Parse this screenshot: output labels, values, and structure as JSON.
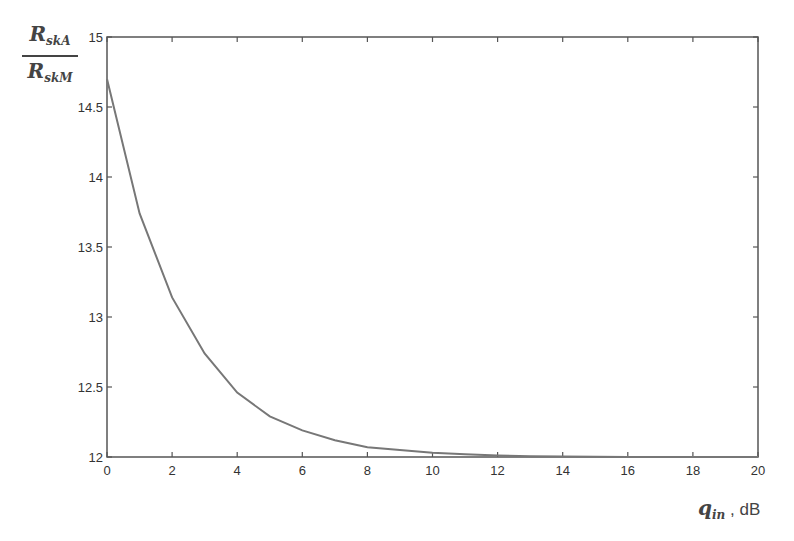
{
  "chart_data": {
    "type": "line",
    "title": "",
    "xlabel": "q_in , dB",
    "ylabel": "R_skA / R_skM",
    "xlim": [
      0,
      20
    ],
    "ylim": [
      12,
      15
    ],
    "xticks": [
      0,
      2,
      4,
      6,
      8,
      10,
      12,
      14,
      16,
      18,
      20
    ],
    "yticks": [
      12,
      12.5,
      13,
      13.5,
      14,
      14.5,
      15
    ],
    "grid": false,
    "legend": null,
    "series": [
      {
        "name": "R_skA/R_skM",
        "color": "#777777",
        "x": [
          0,
          1,
          2,
          3,
          4,
          5,
          6,
          7,
          8,
          9,
          10,
          11,
          12,
          13,
          14,
          15,
          16,
          17,
          18,
          19,
          20
        ],
        "y": [
          14.7,
          13.74,
          13.14,
          12.74,
          12.46,
          12.29,
          12.19,
          12.12,
          12.07,
          12.05,
          12.03,
          12.02,
          12.01,
          12.005,
          12.003,
          12.002,
          12.001,
          12.001,
          12.0,
          12.0,
          12.0
        ]
      }
    ]
  },
  "labels": {
    "y_num_main": "R",
    "y_num_sub": "skA",
    "y_den_main": "R",
    "y_den_sub": "skM",
    "x_main": "q",
    "x_sub": "in",
    "x_unit": " , dB"
  },
  "colors": {
    "axis": "#555555",
    "curve": "#777777",
    "text": "#333333"
  }
}
